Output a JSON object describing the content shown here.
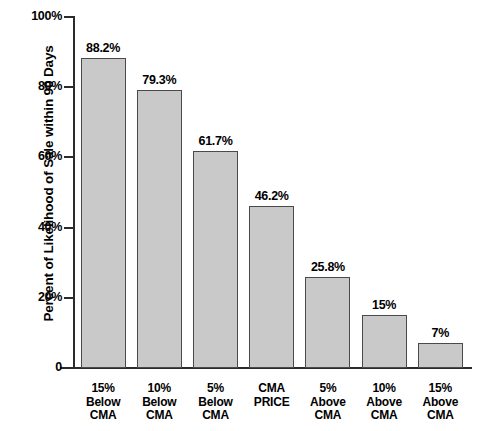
{
  "title_clipped": "Percent of Likelihood of Sale within 90 Days",
  "axis": {
    "y_title": "Percent of Likelihood of Sale within 90 Days",
    "y_ticks": [
      "100%",
      "80%",
      "60%",
      "40%",
      "20%",
      "0"
    ]
  },
  "colors": {
    "bar_fill": "#c9c9c9",
    "bar_border": "#4a4a4a",
    "axis": "#2b2b2b",
    "text": "#000000",
    "background": "#ffffff"
  },
  "chart_data": {
    "type": "bar",
    "title": "Percent of Likelihood of Sale within 90 Days",
    "xlabel": "",
    "ylabel": "Percent of Likelihood of Sale within 90 Days",
    "ylim": [
      0,
      100
    ],
    "yticks": [
      0,
      20,
      40,
      60,
      80,
      100
    ],
    "ytick_labels": [
      "0",
      "20%",
      "40%",
      "60%",
      "80%",
      "100%"
    ],
    "grid": false,
    "legend": false,
    "categories": [
      "15% Below CMA",
      "10% Below CMA",
      "5% Below CMA",
      "CMA PRICE",
      "5% Above CMA",
      "10% Above CMA",
      "15% Above CMA"
    ],
    "category_lines": [
      [
        "15%",
        "Below",
        "CMA"
      ],
      [
        "10%",
        "Below",
        "CMA"
      ],
      [
        "5%",
        "Below",
        "CMA"
      ],
      [
        "CMA",
        "PRICE",
        ""
      ],
      [
        "5%",
        "Above",
        "CMA"
      ],
      [
        "10%",
        "Above",
        "CMA"
      ],
      [
        "15%",
        "Above",
        "CMA"
      ]
    ],
    "values": [
      88.2,
      79.3,
      61.7,
      46.2,
      25.8,
      15,
      7
    ],
    "value_labels": [
      "88.2%",
      "79.3%",
      "61.7%",
      "46.2%",
      "25.8%",
      "15%",
      "7%"
    ]
  }
}
